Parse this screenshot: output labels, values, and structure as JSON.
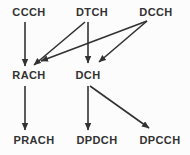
{
  "diagram": {
    "type": "channel-mapping-flow",
    "colors": {
      "background": "#fcfcfc",
      "ink": "#323232"
    },
    "nodes": [
      {
        "id": "ccch",
        "label": "CCCH",
        "row": "top"
      },
      {
        "id": "dtch",
        "label": "DTCH",
        "row": "top"
      },
      {
        "id": "dcch",
        "label": "DCCH",
        "row": "top"
      },
      {
        "id": "rach",
        "label": "RACH",
        "row": "middle"
      },
      {
        "id": "dch",
        "label": "DCH",
        "row": "middle"
      },
      {
        "id": "prach",
        "label": "PRACH",
        "row": "bottom"
      },
      {
        "id": "dpdch",
        "label": "DPDCH",
        "row": "bottom"
      },
      {
        "id": "dpcch",
        "label": "DPCCH",
        "row": "bottom"
      }
    ],
    "edges": [
      {
        "from": "CCCH",
        "to": "RACH",
        "x1": 25,
        "y1": 22,
        "x2": 25,
        "y2": 66
      },
      {
        "from": "DTCH",
        "to": "RACH",
        "x1": 85,
        "y1": 22,
        "x2": 34,
        "y2": 65
      },
      {
        "from": "DTCH",
        "to": "DCH",
        "x1": 88,
        "y1": 22,
        "x2": 88,
        "y2": 63
      },
      {
        "from": "DCCH",
        "to": "RACH",
        "x1": 147,
        "y1": 21,
        "x2": 41,
        "y2": 61
      },
      {
        "from": "DCCH",
        "to": "DCH",
        "x1": 147,
        "y1": 21,
        "x2": 99,
        "y2": 62
      },
      {
        "from": "RACH",
        "to": "PRACH",
        "x1": 25,
        "y1": 86,
        "x2": 25,
        "y2": 130
      },
      {
        "from": "DCH",
        "to": "DPDCH",
        "x1": 88,
        "y1": 86,
        "x2": 88,
        "y2": 130
      },
      {
        "from": "DCH",
        "to": "DPCCH",
        "x1": 90,
        "y1": 86,
        "x2": 149,
        "y2": 128
      }
    ]
  }
}
